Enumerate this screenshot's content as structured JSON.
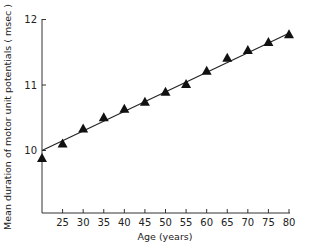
{
  "chart_data": {
    "type": "scatter",
    "title": "",
    "xlabel": "Age (years)",
    "ylabel": "Mean duration of motor unit potentials ( msec )",
    "xlim": [
      20,
      80
    ],
    "ylim": [
      9.0,
      12
    ],
    "x_ticks": [
      25,
      30,
      35,
      40,
      45,
      50,
      55,
      60,
      65,
      70,
      75,
      80
    ],
    "y_ticks": [
      10,
      11,
      12
    ],
    "grid": false,
    "legend": null,
    "series": [
      {
        "name": "Mean duration",
        "marker": "triangle",
        "x": [
          20,
          25,
          30,
          35,
          40,
          45,
          50,
          55,
          60,
          65,
          70,
          75,
          80
        ],
        "y": [
          9.88,
          10.1,
          10.33,
          10.5,
          10.63,
          10.74,
          10.89,
          11.01,
          11.21,
          11.41,
          11.53,
          11.65,
          11.77
        ]
      }
    ],
    "fit_line": {
      "name": "Linear regression",
      "x": [
        20,
        80
      ],
      "y": [
        10.0,
        11.79
      ]
    }
  }
}
